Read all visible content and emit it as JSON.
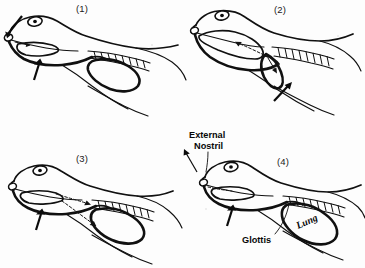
{
  "figure": {
    "background_color": "#fdfdfd",
    "ink_color": "#101010"
  },
  "panels": [
    {
      "id": "panel-1",
      "number_label": "(1)",
      "stage_name": "nostrils-open-mouth-floor-lowered",
      "arrows": [
        {
          "name": "air-in-nostril-arrow",
          "style": "solid",
          "direction": "into-nostril"
        },
        {
          "name": "mouth-floor-lowering-arrow",
          "style": "solid",
          "direction": "up"
        }
      ]
    },
    {
      "id": "panel-2",
      "number_label": "(2)",
      "stage_name": "lung-air-into-buccal-cavity",
      "arrows": [
        {
          "name": "lung-to-mouth-arrow",
          "style": "dashed-curved",
          "direction": "left"
        },
        {
          "name": "body-wall-arrow",
          "style": "solid",
          "direction": "up-left"
        }
      ]
    },
    {
      "id": "panel-3",
      "number_label": "(3)",
      "stage_name": "nostrils-closed-air-forced-into-lung",
      "arrows": [
        {
          "name": "mouth-to-lung-arrow",
          "style": "dashed-curved",
          "direction": "right-down"
        },
        {
          "name": "mouth-floor-raising-arrow",
          "style": "solid",
          "direction": "up"
        }
      ]
    },
    {
      "id": "panel-4",
      "number_label": "(4)",
      "stage_name": "labelled-anatomy",
      "arrows": [
        {
          "name": "external-nostril-pointer-arrow",
          "style": "solid",
          "direction": "up-left"
        },
        {
          "name": "mouth-floor-arrow",
          "style": "solid",
          "direction": "up"
        }
      ]
    }
  ],
  "annotations": [
    {
      "name": "external-nostril-label",
      "text_line_1": "External",
      "text_line_2": "Nostril",
      "style": "upright",
      "points_to": "external-nostril"
    },
    {
      "name": "glottis-label",
      "text_line_1": "Glottis",
      "style": "upright",
      "points_to": "glottis"
    },
    {
      "name": "lung-label",
      "text_line_1": "Lung",
      "style": "italic-rotated",
      "points_to": "lung"
    }
  ],
  "anatomy_parts": [
    {
      "name": "eye",
      "rendered_in_all_panels": true
    },
    {
      "name": "external-nostril",
      "rendered_in_all_panels": true
    },
    {
      "name": "buccal-cavity",
      "rendered_in_all_panels": true
    },
    {
      "name": "glottis",
      "rendered_in_all_panels": true
    },
    {
      "name": "lung",
      "rendered_in_all_panels": true
    },
    {
      "name": "vertebral-column-hatching",
      "rendered_in_all_panels": true
    }
  ]
}
